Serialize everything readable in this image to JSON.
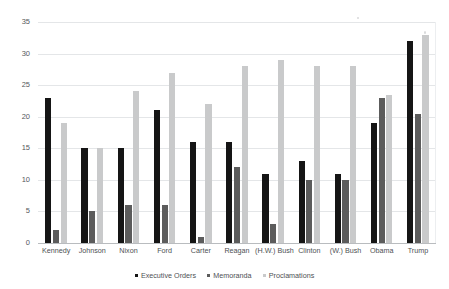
{
  "chart_data": {
    "type": "bar",
    "title": "",
    "subtitle": "",
    "xlabel": "",
    "ylabel": "",
    "ylim": [
      0,
      35
    ],
    "yticks": [
      0,
      5,
      10,
      15,
      20,
      25,
      30,
      35
    ],
    "ytick_labels": [
      "0",
      "5",
      "10",
      "15",
      "20",
      "25",
      "30",
      "35"
    ],
    "grid": true,
    "legend_position": "bottom-center",
    "categories": [
      "Kennedy",
      "Johnson",
      "Nixon",
      "Ford",
      "Carter",
      "Reagan",
      "(H.W.) Bush",
      "Clinton",
      "(W.) Bush",
      "Obama",
      "Trump"
    ],
    "series": [
      {
        "name": "Executive Orders",
        "color": "#151515",
        "values": [
          23,
          15,
          15,
          21,
          16,
          16,
          11,
          13,
          11,
          19,
          32
        ]
      },
      {
        "name": "Memoranda",
        "color": "#5c5c5c",
        "values": [
          2,
          5,
          6,
          6,
          1,
          12,
          3,
          10,
          10,
          23,
          20.5
        ]
      },
      {
        "name": "Proclamations",
        "color": "#c9cacb",
        "values": [
          19,
          15,
          24,
          27,
          22,
          28,
          29,
          28,
          28,
          23.5,
          33
        ]
      }
    ]
  },
  "legend": {
    "items": [
      {
        "label": "Executive Orders",
        "swatch": "eo"
      },
      {
        "label": "Memoranda",
        "swatch": "mem"
      },
      {
        "label": "Proclamations",
        "swatch": "proc"
      }
    ]
  }
}
